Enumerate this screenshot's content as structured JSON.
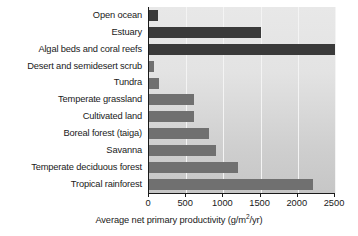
{
  "chart_data": {
    "type": "bar",
    "orientation": "horizontal",
    "title": "",
    "xlabel": "Average net primary productivity (g/m2/yr)",
    "ylabel": "",
    "xlim": [
      0,
      2500
    ],
    "xticks": [
      0,
      500,
      1000,
      1500,
      2000,
      2500
    ],
    "xtick_labels": [
      "0",
      "500",
      "1000",
      "1500",
      "2000",
      "2500"
    ],
    "grid": "vertical-white-gridlines",
    "legend": "none",
    "categories": [
      "Open ocean",
      "Estuary",
      "Algal beds and coral reefs",
      "Desert and semidesert scrub",
      "Tundra",
      "Temperate grassland",
      "Cultivated land",
      "Boreal forest (taiga)",
      "Savanna",
      "Temperate deciduous forest",
      "Tropical rainforest"
    ],
    "values": [
      125,
      1500,
      2500,
      70,
      140,
      600,
      600,
      800,
      900,
      1200,
      2200
    ],
    "bar_colors": [
      "#3a3a3a",
      "#3a3a3a",
      "#3a3a3a",
      "#707070",
      "#707070",
      "#707070",
      "#707070",
      "#707070",
      "#707070",
      "#707070",
      "#707070"
    ]
  },
  "axis_title": {
    "main": "Average net primary productivity (g/m",
    "superscript": "2",
    "tail": "/yr)"
  },
  "colors": {
    "bar_dark": "#3a3a3a",
    "bar_light": "#707070",
    "plot_background_top": "#e8e8e8",
    "plot_background_bottom": "#c6c6c6",
    "gridline": "#f4f4f4",
    "axis_line": "#1a1a1a",
    "text": "#1a1a1a"
  }
}
